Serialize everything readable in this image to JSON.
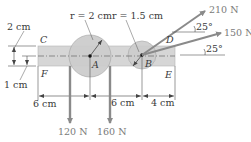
{
  "diagram": {
    "points": {
      "C": "C",
      "D": "D",
      "E": "E",
      "F": "F",
      "A": "A",
      "B": "B"
    },
    "radii": {
      "A": "r = 2 cm",
      "B": "r = 1.5 cm"
    },
    "dimensions": {
      "left_top": "2 cm",
      "left_bottom": "1 cm",
      "bottom_1": "6 cm",
      "bottom_2": "6 cm",
      "bottom_3": "4 cm"
    },
    "forces": [
      {
        "label": "210 N",
        "direction": "25° above horizontal",
        "angle": "25°",
        "color": "#8a8a8a"
      },
      {
        "label": "150 N",
        "direction": "25° above horizontal",
        "angle": "25°",
        "color": "#8a8a8a"
      },
      {
        "label": "120 N",
        "direction": "downward",
        "color": "#8a8a8a"
      },
      {
        "label": "160 N",
        "direction": "downward",
        "color": "#8a8a8a"
      }
    ],
    "colors": {
      "bar_fill": "#d4d4d4",
      "disk_fill": "#cfcfcf",
      "arrow": "#8a8a8a",
      "line": "#555555"
    }
  }
}
